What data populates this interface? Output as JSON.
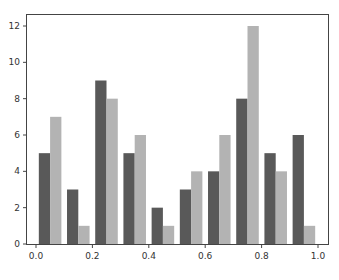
{
  "chart_data": {
    "type": "bar",
    "title": "",
    "xlabel": "",
    "ylabel": "",
    "x": [
      0.05,
      0.15,
      0.25,
      0.35,
      0.45,
      0.55,
      0.65,
      0.75,
      0.85,
      0.95
    ],
    "series": [
      {
        "name": "series-1",
        "color": "#595959",
        "values": [
          5,
          3,
          9,
          5,
          2,
          3,
          4,
          8,
          5,
          6
        ]
      },
      {
        "name": "series-2",
        "color": "#b3b3b3",
        "values": [
          7,
          1,
          8,
          6,
          1,
          4,
          6,
          12,
          4,
          1
        ]
      }
    ],
    "xlim": [
      -0.035,
      1.035
    ],
    "ylim": [
      0,
      12.6
    ],
    "xticks": [
      "0.0",
      "0.2",
      "0.4",
      "0.6",
      "0.8",
      "1.0"
    ],
    "yticks": [
      "0",
      "2",
      "4",
      "6",
      "8",
      "10",
      "12"
    ],
    "bar_width": 0.04,
    "grid": false,
    "legend": false
  }
}
